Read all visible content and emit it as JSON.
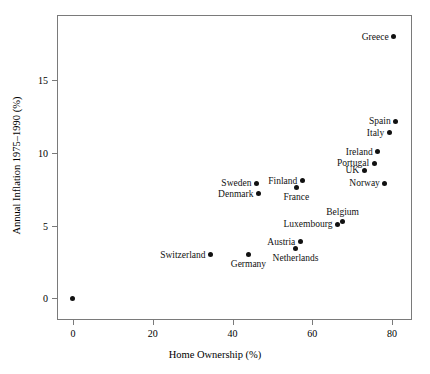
{
  "chart_data": {
    "type": "scatter",
    "title": "",
    "xlabel": "Home Ownership (%)",
    "ylabel": "Annual Inflation 1975–1990 (%)",
    "xlim": [
      -4,
      85
    ],
    "ylim": [
      -1.5,
      19.5
    ],
    "xticks": [
      0,
      20,
      40,
      60,
      80
    ],
    "xtick_labels": [
      "0",
      "20",
      "40",
      "60",
      "80"
    ],
    "yticks": [
      0,
      5,
      10,
      15
    ],
    "ytick_labels": [
      "0",
      "5",
      "10",
      "15"
    ],
    "grid": false,
    "legend": "none",
    "marker": "filled-circle",
    "marker_color": "#111111",
    "frame_color": "#7a7a7a",
    "points": [
      {
        "label": "Greece",
        "x": 80.4,
        "y": 18.0,
        "label_pos": "left"
      },
      {
        "label": "Spain",
        "x": 80.9,
        "y": 12.2,
        "label_pos": "left"
      },
      {
        "label": "Italy",
        "x": 79.3,
        "y": 11.4,
        "label_pos": "left"
      },
      {
        "label": "Ireland",
        "x": 76.4,
        "y": 10.1,
        "label_pos": "left"
      },
      {
        "label": "Portugal",
        "x": 75.5,
        "y": 9.3,
        "label_pos": "left"
      },
      {
        "label": "UK",
        "x": 73.0,
        "y": 8.8,
        "label_pos": "left"
      },
      {
        "label": "Norway",
        "x": 78.2,
        "y": 7.9,
        "label_pos": "left"
      },
      {
        "label": "Finland",
        "x": 57.5,
        "y": 8.1,
        "label_pos": "left"
      },
      {
        "label": "France",
        "x": 56.0,
        "y": 7.6,
        "label_pos": "below"
      },
      {
        "label": "Sweden",
        "x": 46.0,
        "y": 7.9,
        "label_pos": "left"
      },
      {
        "label": "Denmark",
        "x": 46.5,
        "y": 7.2,
        "label_pos": "left"
      },
      {
        "label": "Belgium",
        "x": 67.6,
        "y": 5.3,
        "label_pos": "above"
      },
      {
        "label": "Luxembourg",
        "x": 66.3,
        "y": 5.1,
        "label_pos": "left"
      },
      {
        "label": "Austria",
        "x": 57.0,
        "y": 3.9,
        "label_pos": "left"
      },
      {
        "label": "Netherlands",
        "x": 55.8,
        "y": 3.4,
        "label_pos": "below"
      },
      {
        "label": "Germany",
        "x": 44.0,
        "y": 3.0,
        "label_pos": "below"
      },
      {
        "label": "Switzerland",
        "x": 34.5,
        "y": 3.0,
        "label_pos": "left"
      },
      {
        "label": "Unlabeled",
        "x": 0.0,
        "y": 0.0,
        "label_pos": "none"
      }
    ]
  }
}
